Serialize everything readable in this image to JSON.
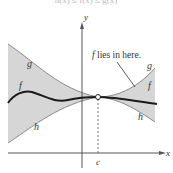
{
  "caption": "h(x) ≤ f(x) ≤ g(x)",
  "axes": {
    "x_label": "x",
    "y_label": "y",
    "c_label": "c"
  },
  "curves": {
    "g_left_label": "g",
    "f_left_label": "f",
    "h_left_label": "h",
    "g_right_label": "g",
    "f_right_label": "f",
    "h_right_label": "h"
  },
  "annotation": {
    "f_prefix": "f",
    "text": " lies in here."
  },
  "colors": {
    "shade": "#d6d6d6",
    "bound_curve": "#8a8a8a",
    "f_curve": "#1a1a1a",
    "axis": "#555555"
  }
}
